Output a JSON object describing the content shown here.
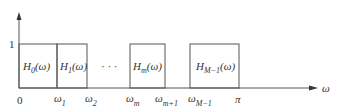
{
  "diagram": {
    "y_axis": {
      "tick_label": "1"
    },
    "x_axis": {
      "label": "ω",
      "origin_label": "0",
      "ticks": [
        {
          "sym": "ω",
          "sub": "1"
        },
        {
          "sym": "ω",
          "sub": "2"
        },
        {
          "sym": "ω",
          "sub": "m"
        },
        {
          "sym": "ω",
          "sub": "m+1"
        },
        {
          "sym": "ω",
          "sub": "M−1"
        },
        {
          "sym": "π",
          "sub": ""
        }
      ]
    },
    "filters": [
      {
        "name": "H",
        "sub": "0",
        "arg": "(ω)"
      },
      {
        "name": "H",
        "sub": "1",
        "arg": "(ω)"
      },
      {
        "name": "H",
        "sub": "m",
        "arg": "(ω)"
      },
      {
        "name": "H",
        "sub": "M−1",
        "arg": "(ω)"
      }
    ],
    "ellipsis": "· · ·"
  }
}
